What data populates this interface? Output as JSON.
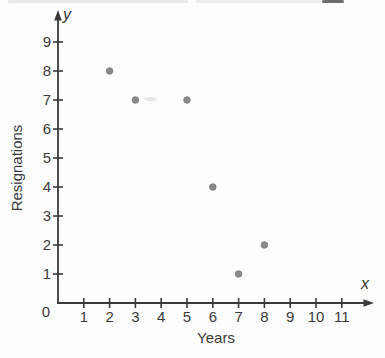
{
  "chart_data": {
    "type": "scatter",
    "title": "",
    "xlabel": "Years",
    "ylabel": "Resignations",
    "x_axis_letter": "x",
    "y_axis_letter": "y",
    "origin_label": "0",
    "x_ticks": [
      1,
      2,
      3,
      4,
      5,
      6,
      7,
      8,
      9,
      10,
      11
    ],
    "y_ticks": [
      1,
      2,
      3,
      4,
      5,
      6,
      7,
      8,
      9
    ],
    "xlim": [
      0,
      12.2
    ],
    "ylim": [
      0,
      10
    ],
    "points": [
      [
        2,
        8
      ],
      [
        3,
        7
      ],
      [
        5,
        7
      ],
      [
        6,
        4
      ],
      [
        7,
        1
      ],
      [
        8,
        2
      ]
    ],
    "grid": false,
    "legend": null,
    "point_color": "#8a8a8a",
    "point_stroke_color": "#7a7a7a",
    "axis_color": "#3a3a3a",
    "label_color": "#3a3a3a"
  }
}
